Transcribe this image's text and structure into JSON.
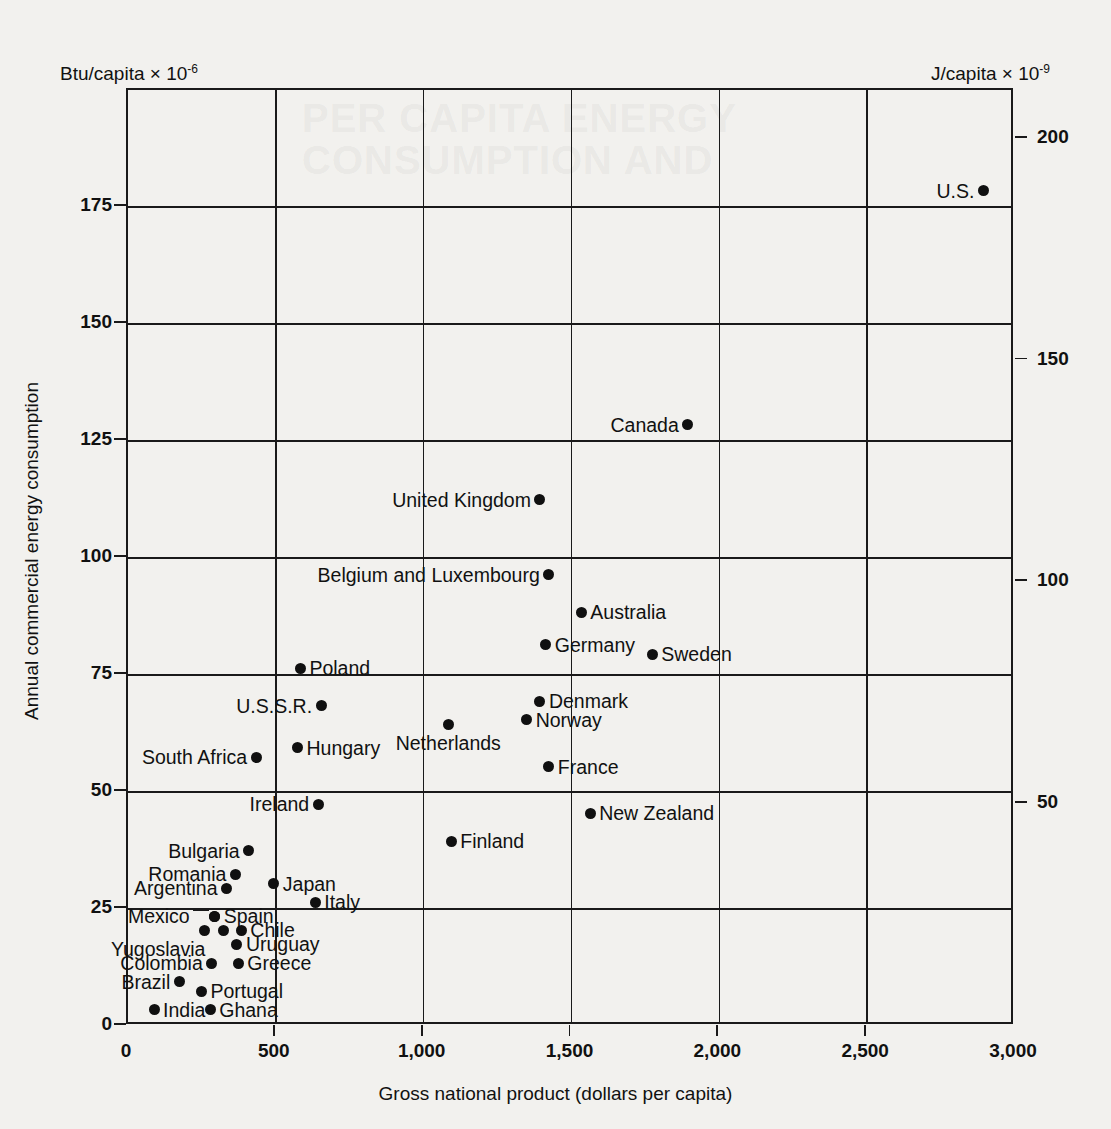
{
  "chart_data": {
    "type": "scatter",
    "title": "",
    "xlabel": "Gross national product (dollars per capita)",
    "ylabel": "Annual commercial energy consumption",
    "left_axis_unit": "Btu/capita × 10",
    "left_axis_unit_exp": "-6",
    "right_axis_unit": "J/capita × 10",
    "right_axis_unit_exp": "-9",
    "xlim": [
      0,
      3000
    ],
    "ylim": [
      0,
      200
    ],
    "grid": true,
    "legend": "none",
    "xticks": [
      {
        "value": 0,
        "label": "0"
      },
      {
        "value": 500,
        "label": "500"
      },
      {
        "value": 1000,
        "label": "1,000"
      },
      {
        "value": 1500,
        "label": "1,500"
      },
      {
        "value": 2000,
        "label": "2,000"
      },
      {
        "value": 2500,
        "label": "2,500"
      },
      {
        "value": 3000,
        "label": "3,000"
      }
    ],
    "yticks_left": [
      {
        "value": 0,
        "label": "0"
      },
      {
        "value": 25,
        "label": "25"
      },
      {
        "value": 50,
        "label": "50"
      },
      {
        "value": 75,
        "label": "75"
      },
      {
        "value": 100,
        "label": "100"
      },
      {
        "value": 125,
        "label": "125"
      },
      {
        "value": 150,
        "label": "150"
      },
      {
        "value": 175,
        "label": "175"
      }
    ],
    "yticks_right": [
      {
        "value": 50,
        "label": "50",
        "btu": 47.4
      },
      {
        "value": 100,
        "label": "100",
        "btu": 94.8
      },
      {
        "value": 150,
        "label": "150",
        "btu": 142.2
      },
      {
        "value": 200,
        "label": "200",
        "btu": 189.6
      }
    ],
    "gridlines_x": [
      500,
      1000,
      1500,
      2000,
      2500
    ],
    "gridlines_y": [
      25,
      50,
      75,
      100,
      125,
      150,
      175
    ],
    "points": [
      {
        "name": "U.S.",
        "x": 2900,
        "y": 178,
        "label_pos": "left"
      },
      {
        "name": "Canada",
        "x": 1900,
        "y": 128,
        "label_pos": "left"
      },
      {
        "name": "United Kingdom",
        "x": 1400,
        "y": 112,
        "label_pos": "left"
      },
      {
        "name": "Belgium and Luxembourg",
        "x": 1430,
        "y": 96,
        "label_pos": "left"
      },
      {
        "name": "Australia",
        "x": 1540,
        "y": 88,
        "label_pos": "right"
      },
      {
        "name": "Germany",
        "x": 1420,
        "y": 81,
        "label_pos": "right"
      },
      {
        "name": "Sweden",
        "x": 1780,
        "y": 79,
        "label_pos": "right"
      },
      {
        "name": "Poland",
        "x": 590,
        "y": 76,
        "label_pos": "right"
      },
      {
        "name": "Denmark",
        "x": 1400,
        "y": 69,
        "label_pos": "right"
      },
      {
        "name": "U.S.S.R.",
        "x": 660,
        "y": 68,
        "label_pos": "left"
      },
      {
        "name": "Norway",
        "x": 1355,
        "y": 65,
        "label_pos": "right"
      },
      {
        "name": "Netherlands",
        "x": 1090,
        "y": 64,
        "label_pos": "below"
      },
      {
        "name": "Hungary",
        "x": 580,
        "y": 59,
        "label_pos": "right"
      },
      {
        "name": "South Africa",
        "x": 440,
        "y": 57,
        "label_pos": "left"
      },
      {
        "name": "France",
        "x": 1430,
        "y": 55,
        "label_pos": "right"
      },
      {
        "name": "Ireland",
        "x": 650,
        "y": 47,
        "label_pos": "left"
      },
      {
        "name": "New Zealand",
        "x": 1570,
        "y": 45,
        "label_pos": "right"
      },
      {
        "name": "Finland",
        "x": 1100,
        "y": 39,
        "label_pos": "right"
      },
      {
        "name": "Bulgaria",
        "x": 415,
        "y": 37,
        "label_pos": "left"
      },
      {
        "name": "Romania",
        "x": 370,
        "y": 32,
        "label_pos": "left"
      },
      {
        "name": "Japan",
        "x": 500,
        "y": 30,
        "label_pos": "right"
      },
      {
        "name": "Argentina",
        "x": 340,
        "y": 29,
        "label_pos": "left"
      },
      {
        "name": "Italy",
        "x": 640,
        "y": 26,
        "label_pos": "right"
      },
      {
        "name": "Spain",
        "x": 300,
        "y": 23,
        "label_pos": "right"
      },
      {
        "name": "Mexico",
        "x": 300,
        "y": 23,
        "label_pos": "leader"
      },
      {
        "name": "Yugoslavia",
        "x": 265,
        "y": 20,
        "label_pos": "below-left"
      },
      {
        "name": "Chile",
        "x": 390,
        "y": 20,
        "label_pos": "right"
      },
      {
        "name": "",
        "x": 330,
        "y": 20,
        "label_pos": "none"
      },
      {
        "name": "Uruguay",
        "x": 375,
        "y": 17,
        "label_pos": "right"
      },
      {
        "name": "Colombia",
        "x": 290,
        "y": 13,
        "label_pos": "left"
      },
      {
        "name": "Greece",
        "x": 380,
        "y": 13,
        "label_pos": "right"
      },
      {
        "name": "Brazil",
        "x": 180,
        "y": 9,
        "label_pos": "left"
      },
      {
        "name": "Portugal",
        "x": 255,
        "y": 7,
        "label_pos": "right"
      },
      {
        "name": "India",
        "x": 95,
        "y": 3,
        "label_pos": "right"
      },
      {
        "name": "Ghana",
        "x": 285,
        "y": 3,
        "label_pos": "right"
      }
    ]
  },
  "ghost": {
    "line1": "PER CAPITA ENERGY",
    "line2": "CONSUMPTION AND"
  }
}
